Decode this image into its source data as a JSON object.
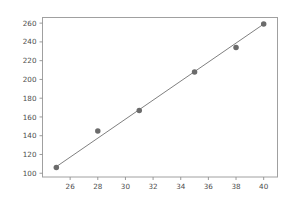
{
  "chart_data": {
    "type": "scatter",
    "title": "",
    "subtitle": "",
    "xlabel": "",
    "ylabel": "",
    "grid": false,
    "legend": null,
    "xlim": [
      24.0,
      41.0
    ],
    "ylim": [
      96.0,
      266.0
    ],
    "xticks": [
      26,
      28,
      30,
      32,
      34,
      36,
      38,
      40
    ],
    "xticklabels": [
      "26",
      "28",
      "30",
      "32",
      "34",
      "36",
      "38",
      "40"
    ],
    "yticks": [
      100,
      120,
      140,
      160,
      180,
      200,
      220,
      240,
      260
    ],
    "yticklabels": [
      "100",
      "120",
      "140",
      "160",
      "180",
      "200",
      "220",
      "240",
      "260"
    ],
    "series": [
      {
        "name": "observations",
        "kind": "scatter",
        "marker": "circle",
        "color": "#6b6b6b",
        "marker_size": 5.5,
        "x": [
          25,
          28,
          31,
          35,
          38,
          40
        ],
        "y": [
          106,
          145,
          167,
          208,
          234,
          259
        ]
      },
      {
        "name": "fit-line",
        "kind": "line",
        "color": "#808080",
        "line_width": 1,
        "x": [
          25,
          40
        ],
        "y": [
          107,
          259
        ]
      }
    ],
    "axes_style": {
      "frame_color": "#a0a0a0",
      "tick_color": "#909090",
      "background": "#ffffff",
      "figure_background": "#ffffff"
    }
  }
}
